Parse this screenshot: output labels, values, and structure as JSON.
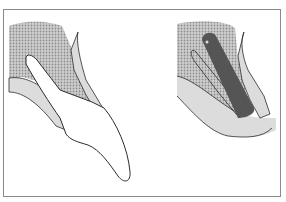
{
  "figure": {
    "panels": [
      {
        "id": "left",
        "description": "natural tooth in alveolar bone with gingiva"
      },
      {
        "id": "right",
        "description": "post / implant placed in socket with outline of root"
      }
    ],
    "colors": {
      "border": "#8a8a8a",
      "bone_dots": "#a9a9a9",
      "gingiva": "#dcdcdc",
      "outline": "#2b2b2b",
      "post": "#555555",
      "tooth": "#ffffff"
    }
  }
}
